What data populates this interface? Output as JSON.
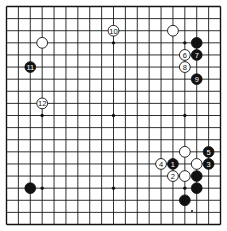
{
  "diagram": {
    "type": "go-board",
    "size": 19,
    "colors": {
      "black": "#111111",
      "white": "#ffffff",
      "line": "#1a1a1a",
      "background": "#ffffff"
    },
    "hoshi": [
      [
        3,
        3
      ],
      [
        9,
        3
      ],
      [
        15,
        3
      ],
      [
        3,
        9
      ],
      [
        9,
        9
      ],
      [
        15,
        9
      ],
      [
        3,
        15
      ],
      [
        9,
        15
      ],
      [
        15,
        15
      ]
    ],
    "stones": [
      {
        "col": 3,
        "row": 3,
        "color": "white",
        "label": ""
      },
      {
        "col": 14,
        "row": 2,
        "color": "white",
        "label": ""
      },
      {
        "col": 16,
        "row": 3,
        "color": "black",
        "label": ""
      },
      {
        "col": 2,
        "row": 15,
        "color": "black",
        "label": ""
      },
      {
        "col": 15,
        "row": 12,
        "color": "white",
        "label": ""
      },
      {
        "col": 16,
        "row": 13,
        "color": "white",
        "label": ""
      },
      {
        "col": 15,
        "row": 14,
        "color": "white",
        "label": ""
      },
      {
        "col": 16,
        "row": 14,
        "color": "black",
        "label": ""
      },
      {
        "col": 16,
        "row": 15,
        "color": "black",
        "label": ""
      },
      {
        "col": 15,
        "row": 16,
        "color": "black",
        "label": ""
      },
      {
        "col": 14,
        "row": 13,
        "color": "black",
        "label": "1"
      },
      {
        "col": 14,
        "row": 14,
        "color": "white",
        "label": "2"
      },
      {
        "col": 17,
        "row": 13,
        "color": "black",
        "label": "3"
      },
      {
        "col": 13,
        "row": 13,
        "color": "white",
        "label": "4"
      },
      {
        "col": 17,
        "row": 12,
        "color": "black",
        "label": "5"
      },
      {
        "col": 15,
        "row": 4,
        "color": "white",
        "label": "6"
      },
      {
        "col": 16,
        "row": 4,
        "color": "black",
        "label": "7"
      },
      {
        "col": 15,
        "row": 5,
        "color": "white",
        "label": "8"
      },
      {
        "col": 16,
        "row": 6,
        "color": "black",
        "label": "9"
      },
      {
        "col": 9,
        "row": 2,
        "color": "white",
        "label": "10"
      },
      {
        "col": 2,
        "row": 5,
        "color": "black",
        "label": "11"
      },
      {
        "col": 3,
        "row": 8,
        "color": "white",
        "label": "12"
      }
    ],
    "marks": [
      {
        "x": 192,
        "y": 211
      }
    ]
  }
}
